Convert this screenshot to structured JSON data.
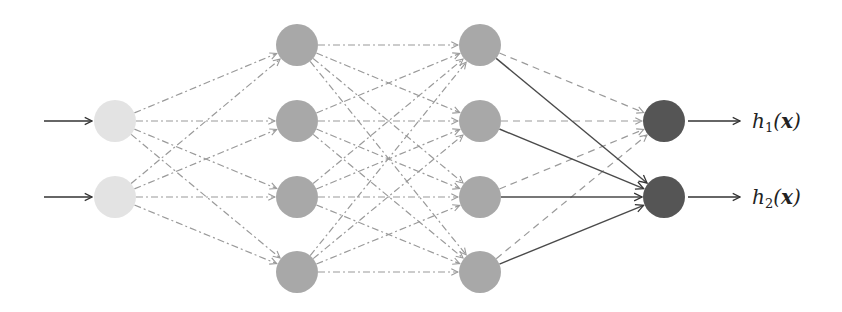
{
  "diagram": {
    "type": "feedforward-neural-network",
    "layers": [
      {
        "name": "input",
        "node_count": 2,
        "x": 115,
        "ys": [
          121,
          197
        ],
        "color": "#e3e3e3"
      },
      {
        "name": "hidden-1",
        "node_count": 4,
        "x": 297,
        "ys": [
          45,
          121,
          197,
          272
        ],
        "color": "#a8a8a8"
      },
      {
        "name": "hidden-2",
        "node_count": 4,
        "x": 480,
        "ys": [
          45,
          121,
          197,
          272
        ],
        "color": "#a8a8a8"
      },
      {
        "name": "output",
        "node_count": 2,
        "x": 664,
        "ys": [
          121,
          197
        ],
        "color": "#555555"
      }
    ],
    "node_radius": 21,
    "edge_styles": {
      "input_to_hidden1": {
        "style": "dash-dot",
        "color": "#9a9a9a"
      },
      "hidden1_to_hidden2": {
        "style": "dash-dot",
        "color": "#9a9a9a"
      },
      "hidden2_to_output1": {
        "style": "dashed",
        "color": "#9a9a9a"
      },
      "hidden2_to_output2": {
        "style": "solid",
        "color": "#4a4a4a"
      }
    },
    "input_arrows": 2,
    "outputs": [
      {
        "label_base": "h",
        "label_sub": "1",
        "label_arg": "x",
        "text": "h1(x)"
      },
      {
        "label_base": "h",
        "label_sub": "2",
        "label_arg": "x",
        "text": "h2(x)"
      }
    ]
  }
}
